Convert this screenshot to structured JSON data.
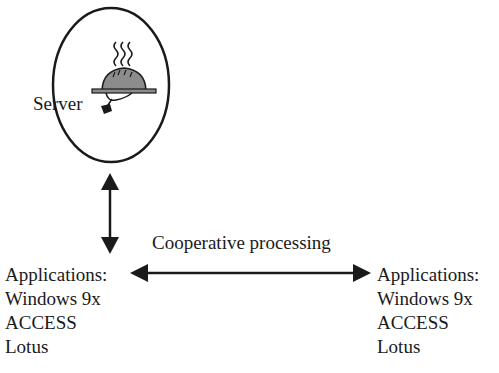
{
  "diagram": {
    "server": {
      "label": "Server",
      "icon": "server-cloche-icon"
    },
    "link_label": "Cooperative processing",
    "left_client": {
      "lines": [
        "Applications:",
        "Windows 9x",
        "ACCESS",
        "Lotus"
      ]
    },
    "right_client": {
      "lines": [
        "Applications:",
        "Windows 9x",
        "ACCESS",
        "Lotus"
      ]
    },
    "arrows": [
      {
        "from": "server",
        "to": "left_client",
        "type": "bidirectional"
      },
      {
        "from": "left_client",
        "to": "right_client",
        "type": "bidirectional",
        "label": "Cooperative processing"
      }
    ],
    "colors": {
      "stroke": "#1a1a1a",
      "dome_fill": "#8c8c8c"
    }
  }
}
